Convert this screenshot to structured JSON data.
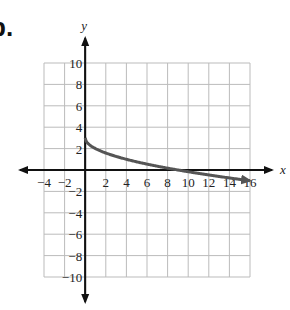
{
  "problem_label": "b.",
  "chart_data": {
    "type": "line",
    "title": "",
    "xlabel": "x",
    "ylabel": "y",
    "xlim": [
      -4,
      16
    ],
    "ylim": [
      -10,
      10
    ],
    "grid": true,
    "x_ticks": [
      -4,
      -2,
      2,
      4,
      6,
      8,
      10,
      12,
      14,
      16
    ],
    "y_ticks": [
      10,
      8,
      6,
      4,
      2,
      -2,
      -4,
      -6,
      -8,
      -10
    ],
    "series": [
      {
        "name": "y = 3 - sqrt(x)",
        "x": [
          0,
          1,
          2,
          4,
          6,
          8,
          9,
          10,
          12,
          14,
          16
        ],
        "y": [
          3,
          2,
          1.59,
          1,
          0.55,
          0.17,
          0,
          -0.16,
          -0.46,
          -0.74,
          -1
        ],
        "color": "#555555",
        "end_arrow": true
      }
    ]
  },
  "colors": {
    "grid": "#bbbbbb",
    "axis": "#111111",
    "curve": "#555555"
  }
}
